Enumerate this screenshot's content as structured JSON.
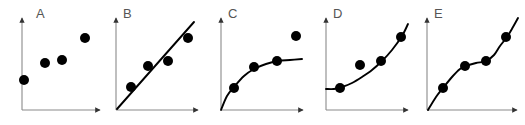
{
  "figure": {
    "title": "",
    "width": 525,
    "height": 125,
    "background": "#ffffff",
    "point_color": "#000000",
    "axis_color": "#8a8a8a",
    "curve_color": "#000000",
    "label_color": "#555555",
    "point_radius": 5
  },
  "chart_data": {
    "type": "scatter",
    "title": "",
    "xlabel": "",
    "ylabel": "",
    "grid": false,
    "legend": null,
    "panels": [
      {
        "label": "A",
        "label_pos": [
          36,
          18
        ],
        "fit": "none",
        "axis": {
          "origin": [
            22,
            110
          ],
          "x_end": [
            100,
            110
          ],
          "y_top": [
            22,
            18
          ],
          "xlim": [
            0,
            1
          ],
          "ylim": [
            0,
            1
          ]
        },
        "points_px": [
          [
            24,
            80
          ],
          [
            45,
            63
          ],
          [
            62,
            60
          ],
          [
            85,
            38
          ]
        ],
        "x": [
          0.03,
          0.29,
          0.51,
          0.81
        ],
        "y": [
          0.33,
          0.51,
          0.54,
          0.78
        ],
        "curve_px": []
      },
      {
        "label": "B",
        "label_pos": [
          123,
          18
        ],
        "fit": "linear",
        "axis": {
          "origin": [
            116,
            110
          ],
          "x_end": [
            198,
            110
          ],
          "y_top": [
            116,
            18
          ],
          "xlim": [
            0,
            1
          ],
          "ylim": [
            0,
            1
          ]
        },
        "points_px": [
          [
            131,
            87
          ],
          [
            148,
            66
          ],
          [
            168,
            61
          ],
          [
            188,
            38
          ]
        ],
        "x": [
          0.18,
          0.39,
          0.63,
          0.88
        ],
        "y": [
          0.25,
          0.48,
          0.53,
          0.78
        ],
        "curve_px": [
          [
            117,
            109
          ],
          [
            194,
            22
          ]
        ]
      },
      {
        "label": "C",
        "label_pos": [
          228,
          18
        ],
        "fit": "logarithmic",
        "axis": {
          "origin": [
            221,
            110
          ],
          "x_end": [
            303,
            110
          ],
          "y_top": [
            221,
            18
          ],
          "xlim": [
            0,
            1
          ],
          "ylim": [
            0,
            1
          ]
        },
        "points_px": [
          [
            234,
            88
          ],
          [
            254,
            67
          ],
          [
            277,
            61
          ],
          [
            296,
            36
          ]
        ],
        "x": [
          0.16,
          0.4,
          0.68,
          0.92
        ],
        "y": [
          0.24,
          0.47,
          0.53,
          0.8
        ],
        "curve_px": [
          [
            221,
            110
          ],
          [
            227,
            96
          ],
          [
            234,
            87
          ],
          [
            244,
            76
          ],
          [
            254,
            69
          ],
          [
            266,
            64
          ],
          [
            278,
            61
          ],
          [
            290,
            60
          ],
          [
            302,
            59
          ]
        ],
        "outlier_index": 3
      },
      {
        "label": "D",
        "label_pos": [
          333,
          18
        ],
        "fit": "exponential",
        "axis": {
          "origin": [
            326,
            110
          ],
          "x_end": [
            408,
            110
          ],
          "y_top": [
            326,
            18
          ],
          "xlim": [
            0,
            1
          ],
          "ylim": [
            0,
            1
          ]
        },
        "points_px": [
          [
            340,
            88
          ],
          [
            360,
            65
          ],
          [
            381,
            61
          ],
          [
            401,
            37
          ]
        ],
        "x": [
          0.17,
          0.41,
          0.67,
          0.91
        ],
        "y": [
          0.24,
          0.49,
          0.53,
          0.79
        ],
        "curve_px": [
          [
            326,
            89
          ],
          [
            334,
            89
          ],
          [
            342,
            87
          ],
          [
            352,
            83
          ],
          [
            362,
            77
          ],
          [
            372,
            70
          ],
          [
            382,
            61
          ],
          [
            392,
            50
          ],
          [
            402,
            36
          ],
          [
            408,
            24
          ]
        ]
      },
      {
        "label": "E",
        "label_pos": [
          434,
          18
        ],
        "fit": "wavy",
        "axis": {
          "origin": [
            427,
            110
          ],
          "x_end": [
            517,
            110
          ],
          "y_top": [
            427,
            18
          ],
          "xlim": [
            0,
            1
          ],
          "ylim": [
            0,
            1
          ]
        },
        "points_px": [
          [
            443,
            88
          ],
          [
            465,
            66
          ],
          [
            486,
            61
          ],
          [
            506,
            37
          ]
        ],
        "x": [
          0.18,
          0.42,
          0.66,
          0.88
        ],
        "y": [
          0.25,
          0.49,
          0.54,
          0.81
        ],
        "curve_px": [
          [
            428,
            110
          ],
          [
            436,
            97
          ],
          [
            443,
            88
          ],
          [
            452,
            77
          ],
          [
            460,
            69
          ],
          [
            466,
            66
          ],
          [
            476,
            63
          ],
          [
            486,
            61
          ],
          [
            494,
            55
          ],
          [
            500,
            46
          ],
          [
            507,
            37
          ],
          [
            513,
            27
          ],
          [
            518,
            18
          ]
        ]
      }
    ]
  }
}
